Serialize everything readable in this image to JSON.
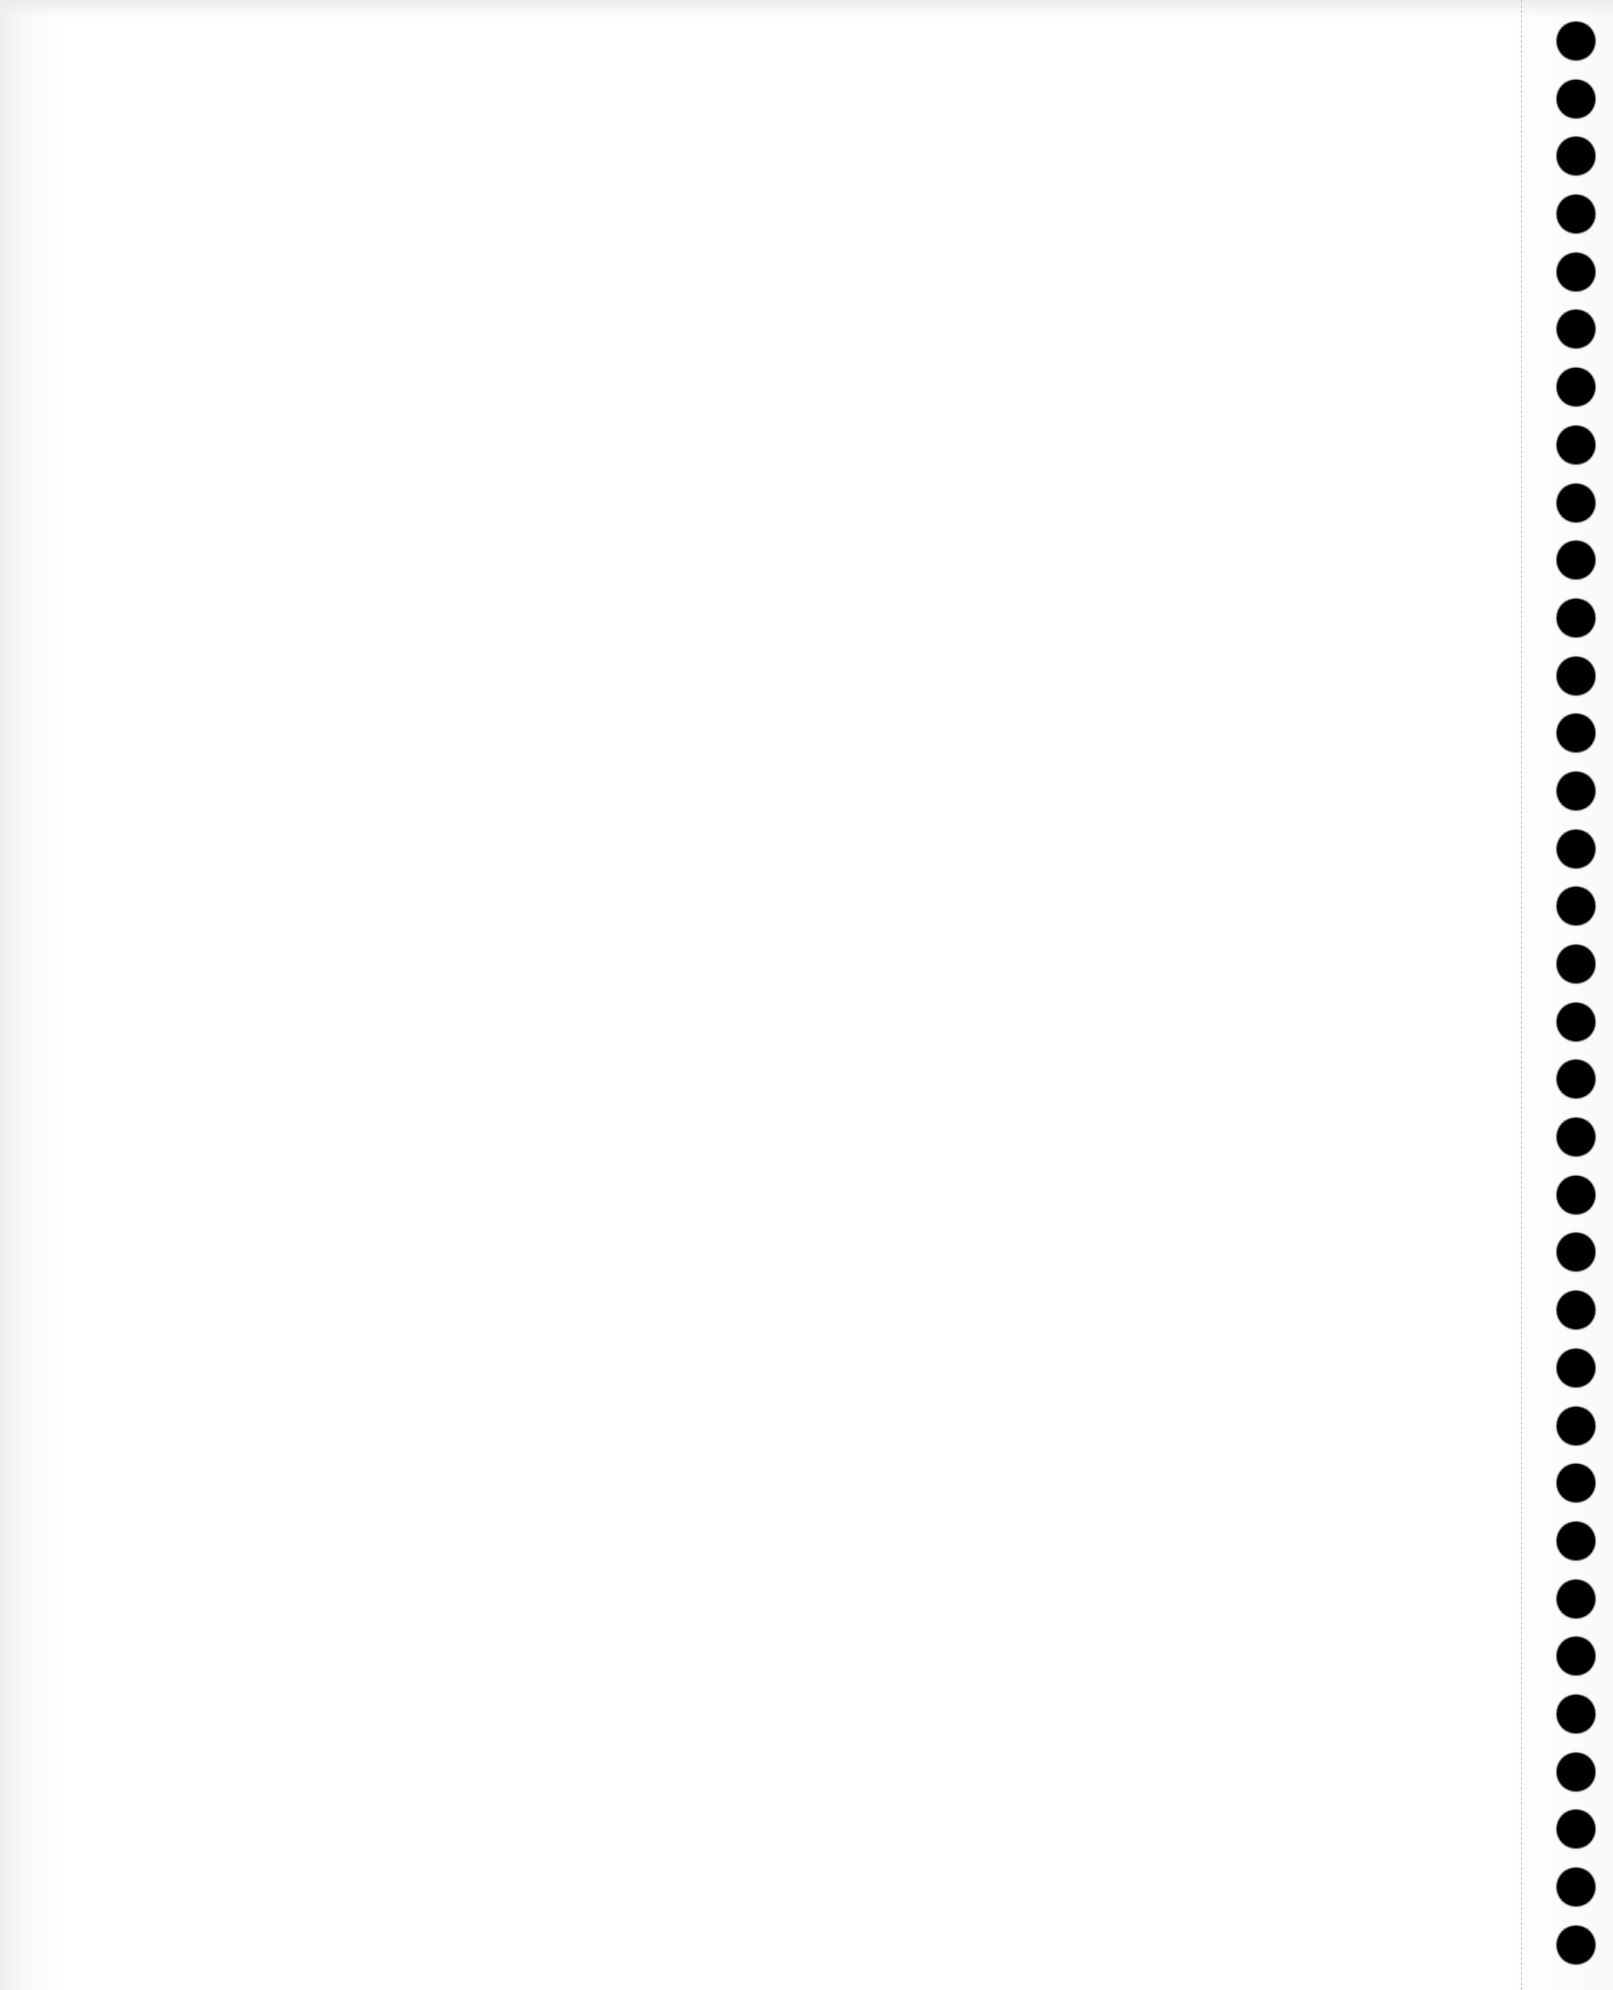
{
  "page": {
    "type": "blank-spiral-notebook-page",
    "background_color": "#ffffff",
    "hole_color": "#000000",
    "perforation_color": "#c8c8c8",
    "hole_count": 34
  }
}
